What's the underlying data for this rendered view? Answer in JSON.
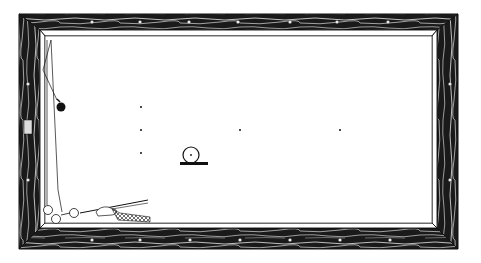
{
  "diagram": {
    "type": "billiards-table-shot-diagram",
    "style": "engraving / line-art",
    "colors": {
      "background": "#ffffff",
      "ink": "#111111",
      "rail_dark": "#1a1a1a",
      "rail_light": "#e8e8e8",
      "cloth": "#ffffff"
    },
    "table": {
      "outer": {
        "x": 19,
        "y": 14,
        "w": 439,
        "h": 235
      },
      "cushion_inner": {
        "x": 40,
        "y": 30,
        "w": 397,
        "h": 198
      },
      "bed": {
        "x": 45,
        "y": 36,
        "w": 387,
        "h": 187
      }
    },
    "diamonds": {
      "top": [
        92,
        140,
        189,
        238,
        290,
        337,
        388
      ],
      "bottom": [
        92,
        140,
        190,
        240,
        290,
        340,
        390
      ],
      "left": [
        50,
        84,
        130,
        180
      ],
      "right": [
        50,
        84,
        130,
        180
      ]
    },
    "spots": [
      {
        "name": "spot-1",
        "x": 141,
        "y": 107
      },
      {
        "name": "spot-2",
        "x": 141,
        "y": 130
      },
      {
        "name": "spot-3",
        "x": 141,
        "y": 153
      },
      {
        "name": "spot-4",
        "x": 240,
        "y": 130
      },
      {
        "name": "spot-5",
        "x": 340,
        "y": 130
      }
    ],
    "balls": [
      {
        "name": "black-object-ball",
        "x": 61,
        "y": 107,
        "r": 4.5,
        "fill": "#111111"
      },
      {
        "name": "spot-ball-on-base",
        "x": 191,
        "y": 155,
        "r": 8,
        "fill": "#ffffff"
      },
      {
        "name": "cluster-ball-1",
        "x": 48,
        "y": 210,
        "r": 4.5,
        "fill": "#ffffff"
      },
      {
        "name": "cluster-ball-2",
        "x": 56,
        "y": 218,
        "r": 4.5,
        "fill": "#ffffff"
      },
      {
        "name": "cue-ball",
        "x": 74,
        "y": 213,
        "r": 4.5,
        "fill": "#ffffff"
      }
    ],
    "ball_path": {
      "points": [
        [
          51,
          40
        ],
        [
          43,
          70
        ],
        [
          58,
          100
        ]
      ]
    },
    "cue": {
      "tip": [
        81,
        212
      ],
      "butt": [
        148,
        200
      ]
    },
    "rail_marking": "illegible"
  }
}
